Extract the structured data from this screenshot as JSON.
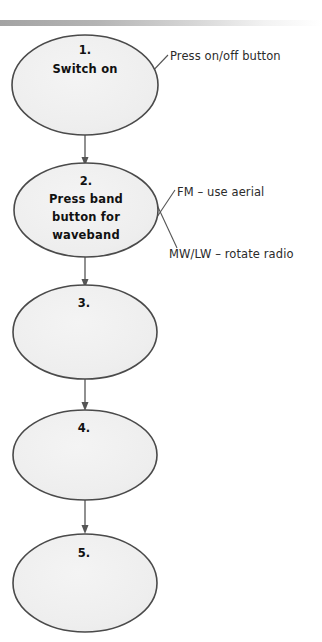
{
  "page": {
    "background_color": "#ffffff",
    "width": 322,
    "height": 642
  },
  "top_bar": {
    "name": "decorative-gradient-bar",
    "start_color": "#a8a8a8",
    "end_color": "#ffffff",
    "y": 11,
    "height": 6
  },
  "diagram": {
    "type": "flowchart",
    "orientation": "vertical",
    "node_fill": "#efefef",
    "node_stroke": "#4a4a4a",
    "connector_color": "#555555",
    "nodes": [
      {
        "id": "node-1",
        "number": "1.",
        "lines": [
          "Switch on"
        ],
        "cx": 85,
        "cy": 85,
        "rx": 73,
        "ry": 50
      },
      {
        "id": "node-2",
        "number": "2.",
        "lines": [
          "Press band",
          "button for",
          "waveband"
        ],
        "cx": 86,
        "cy": 210,
        "rx": 72,
        "ry": 47
      },
      {
        "id": "node-3",
        "number": "3.",
        "lines": [],
        "cx": 85,
        "cy": 332,
        "rx": 72,
        "ry": 47
      },
      {
        "id": "node-4",
        "number": "4.",
        "lines": [],
        "cx": 85,
        "cy": 455,
        "rx": 72,
        "ry": 45
      },
      {
        "id": "node-5",
        "number": "5.",
        "lines": [],
        "cx": 85,
        "cy": 583,
        "rx": 72,
        "ry": 49
      }
    ],
    "annotations": [
      {
        "id": "annotation-1",
        "text": "Press on/off button",
        "x": 170,
        "y": 60,
        "leader_from": [
          147,
          76
        ],
        "leader_to": [
          167,
          56
        ]
      },
      {
        "id": "annotation-2",
        "text": "FM – use aerial",
        "x": 177,
        "y": 197,
        "leader_from": [
          152,
          224
        ],
        "leader_to": [
          174,
          192
        ]
      },
      {
        "id": "annotation-3",
        "text": "MW/LW – rotate radio",
        "x": 168,
        "y": 258,
        "leader_from": [
          152,
          194
        ],
        "leader_to": [
          175,
          247
        ]
      }
    ]
  }
}
